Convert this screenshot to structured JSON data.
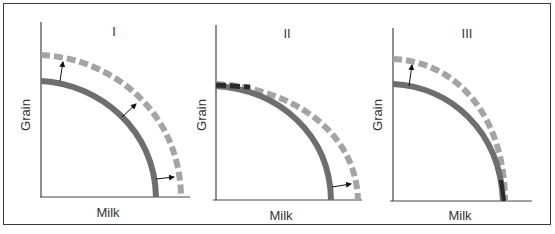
{
  "figure": {
    "colors": {
      "frame": "#3a3a3a",
      "axis": "#444444",
      "solid_curve": "#6e6e6e",
      "dashed_curve": "#a4a4a4",
      "arrow": "#111111",
      "text": "#333333"
    },
    "panels": [
      {
        "id": "I",
        "label": "I",
        "x_axis_label": "Milk",
        "y_axis_label": "Grain",
        "description": "Both intercepts shift outward (parallel outward shift)",
        "original_curve": {
          "grain_intercept": "low",
          "milk_intercept": "low"
        },
        "new_curve": {
          "grain_intercept": "higher",
          "milk_intercept": "higher"
        },
        "arrows": [
          "grain-axis-up",
          "diagonal-outward",
          "milk-axis-right"
        ]
      },
      {
        "id": "II",
        "label": "II",
        "x_axis_label": "Milk",
        "y_axis_label": "Grain",
        "description": "Only milk intercept shifts outward; grain intercept unchanged",
        "original_curve": {
          "grain_intercept": "same",
          "milk_intercept": "low"
        },
        "new_curve": {
          "grain_intercept": "same",
          "milk_intercept": "higher"
        },
        "arrows": [
          "milk-axis-right"
        ]
      },
      {
        "id": "III",
        "label": "III",
        "x_axis_label": "Milk",
        "y_axis_label": "Grain",
        "description": "Only grain intercept shifts outward; milk intercept unchanged",
        "original_curve": {
          "grain_intercept": "low",
          "milk_intercept": "same"
        },
        "new_curve": {
          "grain_intercept": "higher",
          "milk_intercept": "same"
        },
        "arrows": [
          "grain-axis-up"
        ]
      }
    ]
  }
}
